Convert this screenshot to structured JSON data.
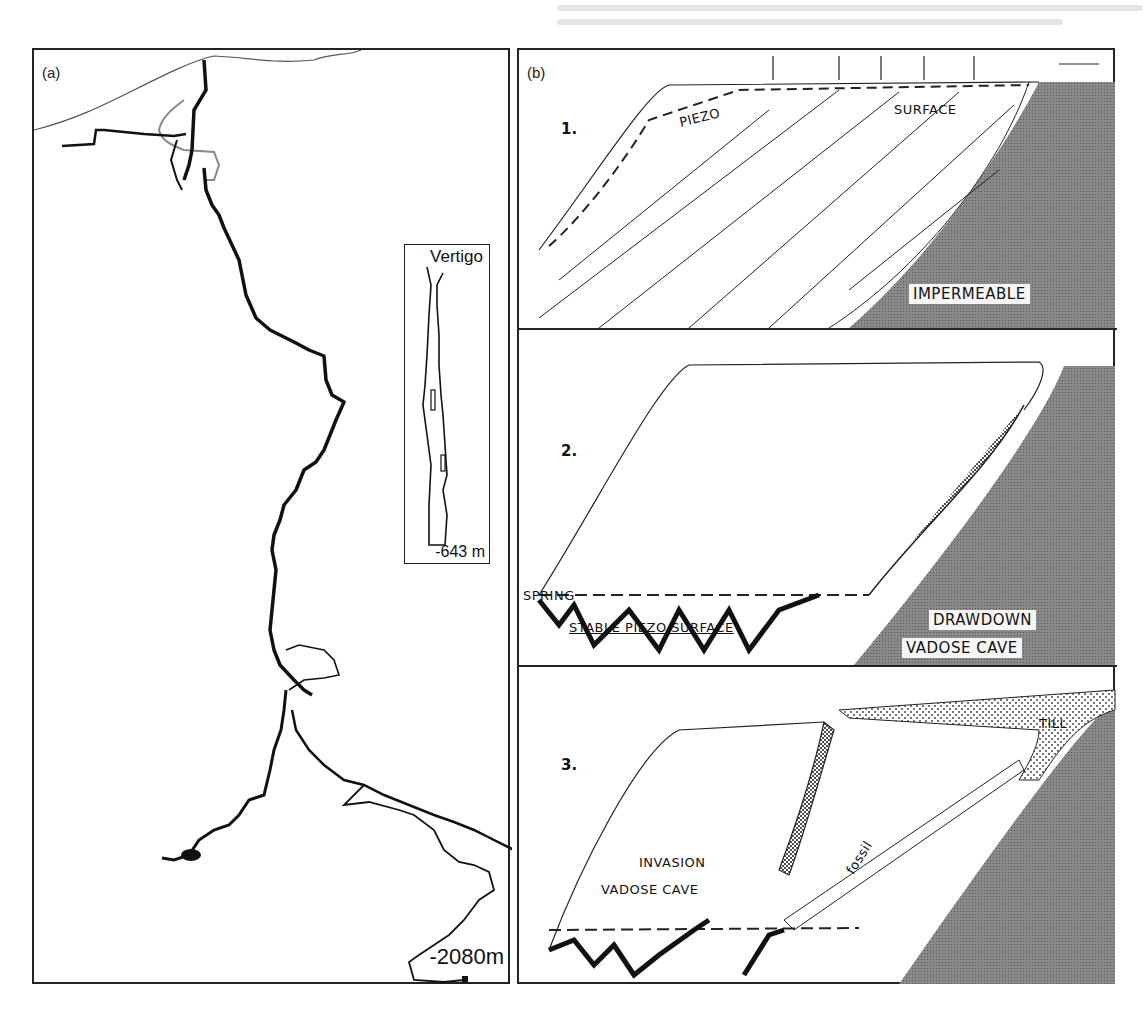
{
  "figure": {
    "panel_a": {
      "label": "(a)",
      "description": "Vertical cave profile (Krubera-Voronja style), with inset of a smaller cave",
      "depth_label": "-2080m",
      "inset": {
        "title": "Vertigo",
        "depth_label": "-643 m"
      }
    },
    "panel_b": {
      "label": "(b)",
      "stages": [
        {
          "number": "1.",
          "labels": {
            "piezo": "PIEZO",
            "surface": "SURFACE",
            "impermeable": "IMPERMEABLE"
          }
        },
        {
          "number": "2.",
          "labels": {
            "spring": "SPRING",
            "stable_piezo_surface": "STABLE PIEZO SURFACE",
            "drawdown": "DRAWDOWN",
            "vadose_cave": "VADOSE CAVE"
          }
        },
        {
          "number": "3.",
          "labels": {
            "till": "TILL",
            "invasion": "INVASION",
            "vadose_cave": "VADOSE CAVE",
            "fossil": "fossil"
          }
        }
      ]
    },
    "colors": {
      "border": "#222222",
      "impermeable_fill": "#7a7a7a",
      "cave_fill": "#111111",
      "hatch": "#333333",
      "till_dots": "#444444",
      "background": "#ffffff"
    }
  }
}
